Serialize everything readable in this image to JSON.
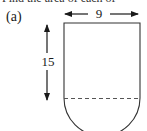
{
  "header": {
    "cut_off_text": "Find the area of each of"
  },
  "figure": {
    "part_label": "(a)",
    "shape": "rectangle with semicircle attached at bottom",
    "width_label": "9",
    "height_label": "15",
    "divider": "dashed line between rectangle and semicircle"
  }
}
